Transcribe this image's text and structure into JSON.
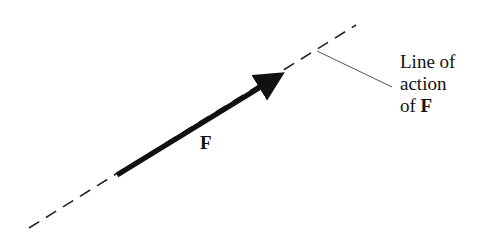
{
  "diagram": {
    "vector_label": "F",
    "annotation": {
      "line1": "Line of",
      "line2": "action",
      "line3_prefix": "of ",
      "line3_symbol": "F"
    },
    "colors": {
      "stroke": "#111111",
      "leader": "#555555",
      "background": "#ffffff"
    }
  }
}
